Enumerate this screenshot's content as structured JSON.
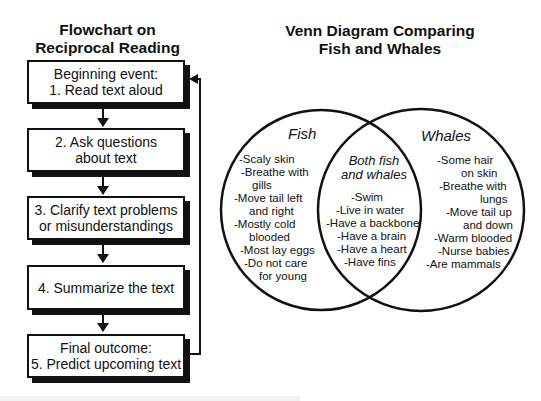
{
  "flowchart": {
    "title_line1": "Flowchart on",
    "title_line2": "Reciprocal Reading",
    "steps": [
      {
        "line1": "Beginning event:",
        "line2": "1. Read text aloud"
      },
      {
        "line1": "2.  Ask questions",
        "line2": "about text"
      },
      {
        "line1": "3.  Clarify text problems",
        "line2": "or misunderstandings"
      },
      {
        "line1": "4.  Summarize the text",
        "line2": ""
      },
      {
        "line1": "Final outcome:",
        "line2": "5.  Predict upcoming text"
      }
    ]
  },
  "venn": {
    "title_line1": "Venn Diagram Comparing",
    "title_line2": "Fish and Whales",
    "left": {
      "label": "Fish",
      "items": [
        "-Scaly skin",
        "-Breathe with",
        "gills",
        "-Move tail left",
        "and right",
        "-Mostly cold",
        "blooded",
        "-Most lay eggs",
        "-Do not care",
        "for young"
      ]
    },
    "center": {
      "label_line1": "Both fish",
      "label_line2": "and whales",
      "items": [
        "-Swim",
        "-Live in water",
        "-Have a backbone",
        "-Have a brain",
        "-Have a heart",
        "-Have fins"
      ]
    },
    "right": {
      "label": "Whales",
      "items": [
        "-Some hair",
        "on skin",
        "-Breathe with",
        "lungs",
        "-Move tail up",
        "and down",
        "-Warm blooded",
        "-Nurse babies",
        "-Are mammals"
      ]
    }
  }
}
